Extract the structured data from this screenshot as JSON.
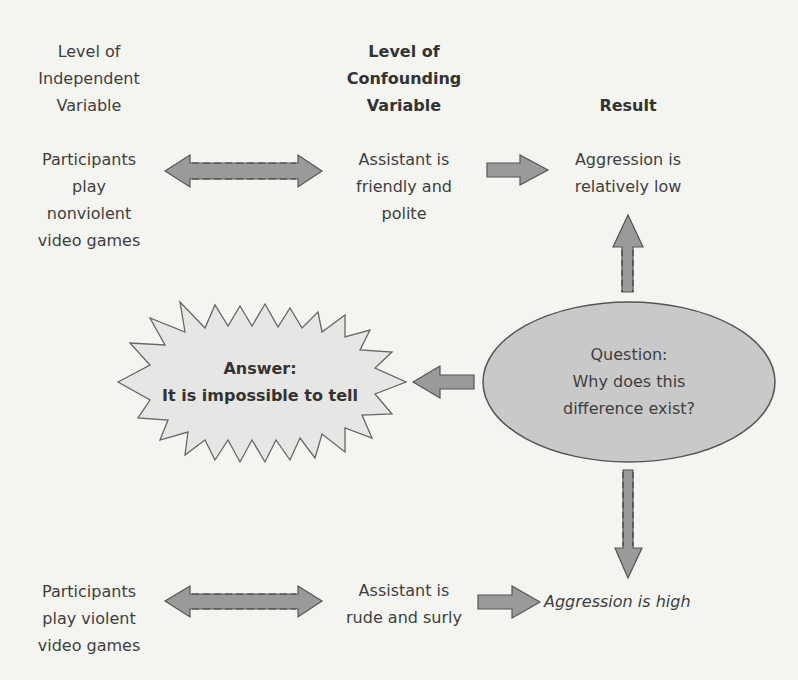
{
  "columns": {
    "independent": {
      "heading": "Level of\nIndependent\nVariable"
    },
    "confounding": {
      "heading": "Level of\nConfounding\nVariable"
    },
    "result": {
      "heading": "Result"
    }
  },
  "row_top": {
    "independent": "Participants\nplay\nnonviolent\nvideo games",
    "confounding": "Assistant is\nfriendly and\npolite",
    "result": "Aggression is\nrelatively low"
  },
  "row_bottom": {
    "independent": "Participants\nplay violent\nvideo games",
    "confounding": "Assistant is\nrude and surly",
    "result": "Aggression is high"
  },
  "question": {
    "text": "Question:\nWhy does this\ndifference exist?"
  },
  "answer": {
    "label": "Answer:",
    "text": "It is impossible to tell"
  },
  "colors": {
    "background": "#f4f4f1",
    "text": "#3f3f3f",
    "arrow_fill": "#9a9a9a",
    "arrow_stroke": "#555555",
    "ellipse_fill": "#c9c9c9",
    "burst_fill": "#e6e6e4"
  }
}
